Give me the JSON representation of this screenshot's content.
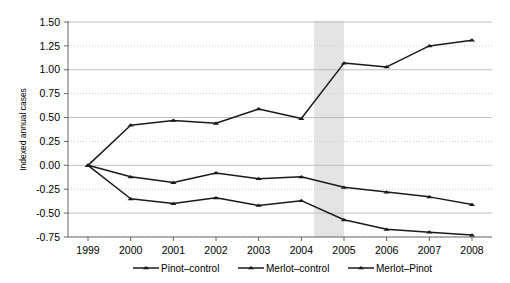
{
  "chart_data": {
    "type": "line",
    "title": "",
    "xlabel": "",
    "ylabel": "Indexed annual cases",
    "x": [
      1999,
      2000,
      2001,
      2002,
      2003,
      2004,
      2005,
      2006,
      2007,
      2008
    ],
    "categories": [
      "1999",
      "2000",
      "2001",
      "2002",
      "2003",
      "2004",
      "2005",
      "2006",
      "2007",
      "2008"
    ],
    "ylim": [
      -0.75,
      1.5
    ],
    "xlim": [
      1999,
      2008
    ],
    "yticks": [
      1.5,
      1.25,
      1.0,
      0.75,
      0.5,
      0.25,
      0.0,
      -0.25,
      -0.5,
      -0.75
    ],
    "ytick_labels": [
      "1.50",
      "1.25",
      "1.00",
      "0.75",
      "0.50",
      "0.25",
      "0.00",
      "-0.25",
      "-0.50",
      "-0.75"
    ],
    "grid": true,
    "grid_style": "alternating solid and dotted horizontal gridlines",
    "legend_position": "bottom",
    "marker": "triangle",
    "line_color": "#1a1a1a",
    "shaded_band": {
      "label": "",
      "x_start": 2004.3,
      "x_end": 2005.0,
      "color": "#e4e4e4"
    },
    "series": [
      {
        "name": "Pinot–control",
        "values": [
          0.0,
          -0.12,
          -0.18,
          -0.08,
          -0.14,
          -0.12,
          -0.23,
          -0.28,
          -0.33,
          -0.41
        ]
      },
      {
        "name": "Merlot–control",
        "values": [
          0.0,
          -0.35,
          -0.4,
          -0.34,
          -0.42,
          -0.37,
          -0.57,
          -0.67,
          -0.7,
          -0.73
        ]
      },
      {
        "name": "Merlot–Pinot",
        "values": [
          0.0,
          0.42,
          0.47,
          0.44,
          0.59,
          0.49,
          1.07,
          1.03,
          1.25,
          1.31
        ]
      }
    ]
  },
  "legend": {
    "items": [
      {
        "label": "Pinot–control"
      },
      {
        "label": "Merlot–control"
      },
      {
        "label": "Merlot–Pinot"
      }
    ]
  },
  "axes": {
    "y_title": "Indexed annual cases"
  }
}
